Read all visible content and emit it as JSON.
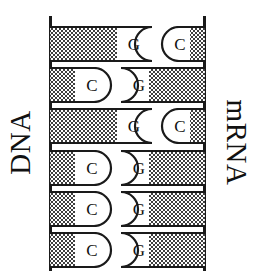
{
  "figure": {
    "type": "base-pairing-diagram",
    "left_label": "DNA",
    "right_label": "mRNA",
    "row_count": 6
  },
  "labels": {
    "dna": "DNA",
    "mrna": "mRNA"
  },
  "rows": [
    {
      "index": 1,
      "dna_base": "G",
      "mrna_base": "C",
      "joint": "dna-concave"
    },
    {
      "index": 2,
      "dna_base": "C",
      "mrna_base": "G",
      "joint": "dna-convex"
    },
    {
      "index": 3,
      "dna_base": "G",
      "mrna_base": "C",
      "joint": "dna-concave"
    },
    {
      "index": 4,
      "dna_base": "C",
      "mrna_base": "G",
      "joint": "dna-convex"
    },
    {
      "index": 5,
      "dna_base": "C",
      "mrna_base": "G",
      "joint": "dna-convex"
    },
    {
      "index": 6,
      "dna_base": "C",
      "mrna_base": "G",
      "joint": "dna-convex"
    }
  ],
  "colors": {
    "ink": "#1a1a1a",
    "paper": "#ffffff",
    "stipple": "#4a4a4a"
  }
}
